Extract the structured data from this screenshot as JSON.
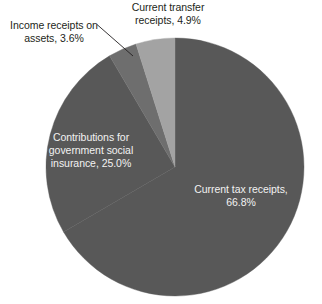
{
  "chart_data": {
    "type": "pie",
    "title": "",
    "subtitle": "",
    "xlabel": "",
    "ylabel": "",
    "legend_position": "none",
    "grid": false,
    "labels_as_drawn": [
      "Current tax receipts, 66.8%",
      "Contributions for government social insurance, 25.0%",
      "Income receipts on assets, 3.6%",
      "Current transfer receipts, 4.9%"
    ],
    "categories": [
      "Current tax receipts",
      "Contributions for government social insurance",
      "Income receipts on assets",
      "Current transfer receipts"
    ],
    "values": [
      66.8,
      25.0,
      3.6,
      4.9
    ],
    "value_unit": "percent",
    "total": 100.3,
    "slices": [
      {
        "name": "Current tax receipts",
        "value": 66.8,
        "value_text": "66.8%",
        "label_text": "Current tax receipts,\n66.8%",
        "color": "#585858",
        "label_placement": "inside",
        "start_angle_deg": 0.0,
        "end_angle_deg": 240.5
      },
      {
        "name": "Contributions for government social insurance",
        "value": 25.0,
        "value_text": "25.0%",
        "label_text": "Contributions for\ngovernment social\ninsurance, 25.0%",
        "color": "#585858",
        "label_placement": "inside",
        "start_angle_deg": 240.5,
        "end_angle_deg": 330.5
      },
      {
        "name": "Income receipts on assets",
        "value": 3.6,
        "value_text": "3.6%",
        "label_text": "Income receipts on\nassets, 3.6%",
        "color": "#6e6e6e",
        "label_placement": "outside-leader",
        "start_angle_deg": 330.5,
        "end_angle_deg": 343.5
      },
      {
        "name": "Current transfer receipts",
        "value": 4.9,
        "value_text": "4.9%",
        "label_text": "Current transfer\nreceipts, 4.9%",
        "color": "#a3a3a3",
        "label_placement": "outside",
        "start_angle_deg": 343.5,
        "end_angle_deg": 360.0
      }
    ],
    "colors": {
      "background": "#ffffff",
      "slice_dark": "#585858",
      "slice_medium": "#6e6e6e",
      "slice_light": "#a3a3a3",
      "label_outside_text": "#231f20",
      "label_inside_text": "#f2f2f2",
      "leader_line": "#231f20"
    },
    "geometry": {
      "center_x": 175,
      "center_y": 167,
      "radius": 129
    }
  },
  "labels": {
    "income_receipts": "Income receipts on\nassets, 3.6%",
    "current_transfer": "Current transfer\nreceipts, 4.9%",
    "contributions": "Contributions for\ngovernment social\ninsurance, 25.0%",
    "current_tax": "Current tax receipts,\n66.8%"
  }
}
